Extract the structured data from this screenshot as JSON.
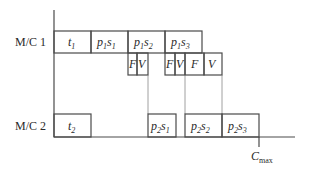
{
  "diagram": {
    "type": "gantt-chart",
    "machines": [
      {
        "label": "M/C 1"
      },
      {
        "label": "M/C 2"
      }
    ],
    "mc1_tasks": [
      {
        "main": "t",
        "sub": "1"
      },
      {
        "main": "p",
        "sub": "1",
        "main2": "s",
        "sub2": "1"
      },
      {
        "main": "p",
        "sub": "1",
        "main2": "s",
        "sub2": "2"
      },
      {
        "main": "p",
        "sub": "1",
        "main2": "s",
        "sub2": "3"
      }
    ],
    "mc1_subtasks": [
      {
        "label": "F"
      },
      {
        "label": "V"
      },
      {
        "label": "F"
      },
      {
        "label": "V"
      },
      {
        "label": "F"
      },
      {
        "label": "V"
      }
    ],
    "mc2_tasks": [
      {
        "main": "t",
        "sub": "2"
      },
      {
        "main": "p",
        "sub": "2",
        "main2": "s",
        "sub2": "1"
      },
      {
        "main": "p",
        "sub": "2",
        "main2": "s",
        "sub2": "2"
      },
      {
        "main": "p",
        "sub": "2",
        "main2": "s",
        "sub2": "3"
      }
    ],
    "cmax": {
      "main": "C",
      "sub": "max"
    }
  }
}
